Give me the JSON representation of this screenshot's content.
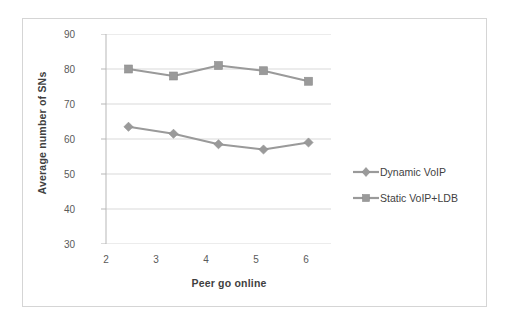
{
  "chart_data": {
    "type": "line",
    "title": "",
    "xlabel": "Peer go online",
    "ylabel": "Average number of SNs",
    "categories": [
      2,
      3,
      4,
      5,
      6
    ],
    "x": [
      2,
      3,
      4,
      5,
      6
    ],
    "xlim": [
      1.5,
      6.5
    ],
    "ylim": [
      30,
      90
    ],
    "yticks": [
      30,
      40,
      50,
      60,
      70,
      80,
      90
    ],
    "xticks": [
      2,
      3,
      4,
      5,
      6
    ],
    "grid": true,
    "legend_position": "right",
    "series": [
      {
        "name": "Dynamic VoIP",
        "marker": "diamond",
        "color": "#9a9a9a",
        "values": [
          63.5,
          61.5,
          58.5,
          57.0,
          59.0
        ]
      },
      {
        "name": "Static VoIP+LDB",
        "marker": "square",
        "color": "#9a9a9a",
        "values": [
          80.0,
          78.0,
          81.0,
          79.5,
          76.5
        ]
      }
    ]
  },
  "axis": {
    "y_tick_labels": [
      "90",
      "80",
      "70",
      "60",
      "50",
      "40",
      "30"
    ],
    "x_tick_labels": [
      "2",
      "3",
      "4",
      "5",
      "6"
    ],
    "y_title": "Average number of SNs",
    "x_title": "Peer go online"
  },
  "legend": {
    "items": [
      {
        "label": "Dynamic VoIP",
        "marker": "diamond-marker-icon"
      },
      {
        "label": "Static VoIP+LDB",
        "marker": "square-marker-icon"
      }
    ]
  },
  "colors": {
    "series": "#9a9a9a",
    "gridline": "#d9d9d9",
    "axis": "#b7b7b7",
    "border": "#d5d5d5",
    "text": "#3f3f3f",
    "tick_text": "#5a5a5a",
    "background": "#ffffff"
  }
}
